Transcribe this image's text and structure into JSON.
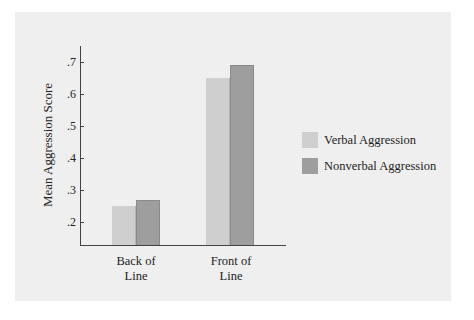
{
  "chart_data": {
    "type": "bar",
    "title": "",
    "xlabel": "",
    "ylabel": "Mean Aggression Score",
    "ylim": [
      0.13,
      0.75
    ],
    "yticks": [
      ".2",
      ".3",
      ".4",
      ".5",
      ".6",
      ".7"
    ],
    "categories": [
      "Back of Line",
      "Front of Line"
    ],
    "category_lines": [
      [
        "Back of",
        "Line"
      ],
      [
        "Front of",
        "Line"
      ]
    ],
    "series": [
      {
        "name": "Verbal Aggression",
        "color": "#cfcfcf",
        "values": [
          0.25,
          0.65
        ]
      },
      {
        "name": "Nonverbal Aggression",
        "color": "#9e9e9e",
        "values": [
          0.27,
          0.69
        ]
      }
    ],
    "grid": false,
    "legend_position": "right"
  }
}
